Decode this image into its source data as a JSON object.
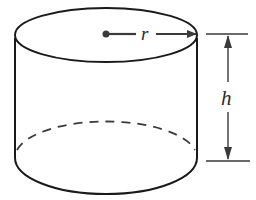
{
  "diagram": {
    "type": "cylinder",
    "labels": {
      "radius": "r",
      "height": "h"
    },
    "colors": {
      "background": "#ffffff",
      "outline": "#1a1a1a",
      "dimension": "#3a3a3a"
    }
  }
}
